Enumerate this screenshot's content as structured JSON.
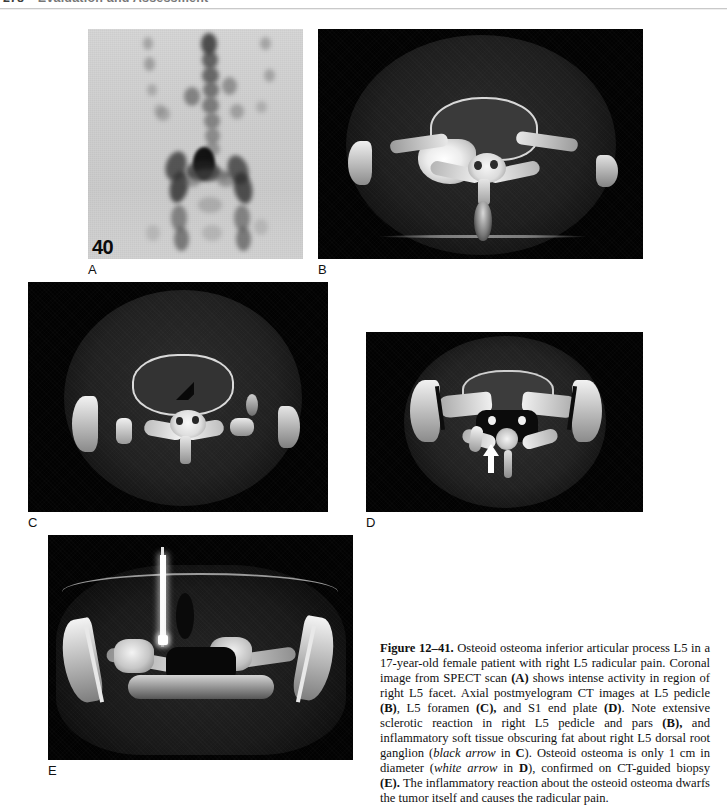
{
  "header": {
    "folio": "278",
    "running_title": "Evaluation and Assessment"
  },
  "figure": {
    "number": "Figure 12–41.",
    "panels": [
      {
        "id": "A",
        "label": "A",
        "modality": "SPECT coronal bone scan",
        "marker": "40"
      },
      {
        "id": "B",
        "label": "B",
        "modality": "Axial postmyelogram CT at L5 pedicle"
      },
      {
        "id": "C",
        "label": "C",
        "modality": "Axial postmyelogram CT at L5 foramen"
      },
      {
        "id": "D",
        "label": "D",
        "modality": "Axial postmyelogram CT at S1 end plate"
      },
      {
        "id": "E",
        "label": "E",
        "modality": "CT-guided biopsy"
      }
    ],
    "caption": {
      "figure_number": "Figure 12–41.",
      "segments": [
        {
          "text": " Osteoid osteoma inferior articular process L5 in a 17-year-old female patient with right L5 radicular pain. Coronal image from SPECT scan ",
          "style": "normal"
        },
        {
          "text": "(A)",
          "style": "bold"
        },
        {
          "text": " shows intense activity in region of right L5 facet. Axial postmyelogram CT images at L5 pedicle ",
          "style": "normal"
        },
        {
          "text": "(B)",
          "style": "bold"
        },
        {
          "text": ", L5 foramen ",
          "style": "normal"
        },
        {
          "text": "(C),",
          "style": "bold"
        },
        {
          "text": " and S1 end plate ",
          "style": "normal"
        },
        {
          "text": "(D)",
          "style": "bold"
        },
        {
          "text": ". Note extensive sclerotic reaction in right L5 pedicle and pars ",
          "style": "normal"
        },
        {
          "text": "(B),",
          "style": "bold"
        },
        {
          "text": " and inflammatory soft tissue obscuring fat about right L5 dorsal root ganglion (",
          "style": "normal"
        },
        {
          "text": "black arrow",
          "style": "italic"
        },
        {
          "text": " in ",
          "style": "normal"
        },
        {
          "text": "C",
          "style": "bold"
        },
        {
          "text": "). Osteoid osteoma is only 1 cm in diameter (",
          "style": "normal"
        },
        {
          "text": "white arrow",
          "style": "italic"
        },
        {
          "text": " in ",
          "style": "normal"
        },
        {
          "text": "D",
          "style": "bold"
        },
        {
          "text": "), confirmed on CT-guided biopsy ",
          "style": "normal"
        },
        {
          "text": "(E).",
          "style": "bold"
        },
        {
          "text": " The inflammatory reaction about the osteoid osteoma dwarfs the tumor itself and causes the radicular pain.",
          "style": "normal"
        }
      ]
    }
  }
}
